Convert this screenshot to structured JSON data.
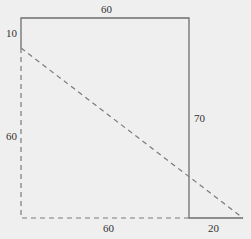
{
  "diagram": {
    "colors": {
      "background": "#efefef",
      "solid_line": "#6e6e6e",
      "dashed_line": "#7a7a7a",
      "text": "#333333"
    },
    "labels": {
      "top": "60",
      "top_left": "10",
      "left": "60",
      "right": "70",
      "bottom": "60",
      "bottom_right": "20"
    },
    "segments": [
      {
        "name": "top-edge",
        "style": "solid",
        "from": [
          21,
          18
        ],
        "to": [
          189,
          18
        ],
        "length_label": "60"
      },
      {
        "name": "left-upper-edge",
        "style": "solid",
        "from": [
          21,
          18
        ],
        "to": [
          21,
          48
        ],
        "length_label": "10"
      },
      {
        "name": "left-lower-edge",
        "style": "dashed",
        "from": [
          21,
          48
        ],
        "to": [
          21,
          218
        ],
        "length_label": "60"
      },
      {
        "name": "bottom-edge",
        "style": "dashed",
        "from": [
          21,
          218
        ],
        "to": [
          189,
          218
        ],
        "length_label": "60"
      },
      {
        "name": "right-edge",
        "style": "solid",
        "from": [
          189,
          18
        ],
        "to": [
          189,
          218
        ],
        "length_label": "70"
      },
      {
        "name": "bottom-extension",
        "style": "solid",
        "from": [
          189,
          218
        ],
        "to": [
          243,
          218
        ],
        "length_label": "20"
      },
      {
        "name": "diagonal",
        "style": "dashed",
        "from": [
          21,
          48
        ],
        "to": [
          243,
          218
        ]
      }
    ]
  }
}
